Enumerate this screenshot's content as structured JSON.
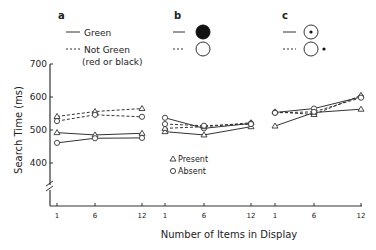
{
  "panels": [
    {
      "label": "a",
      "legend": [
        {
          "style": "solid",
          "text": "Green"
        },
        {
          "style": "dashed",
          "text": "Not Green"
        },
        {
          "style": "none",
          "text": "(red or black)"
        }
      ]
    },
    {
      "label": "b",
      "legend": [
        {
          "style": "solid",
          "icon": "filled-circle"
        },
        {
          "style": "dashed",
          "icon": "open-circle"
        }
      ]
    },
    {
      "label": "c",
      "legend": [
        {
          "style": "solid",
          "icon": "circle-with-dot-inside"
        },
        {
          "style": "dashed",
          "icon": "circle-with-dot-outside"
        }
      ]
    }
  ],
  "marker_legend": {
    "present": "Present",
    "absent": "Absent"
  },
  "axes": {
    "ylabel": "Search Time (ms)",
    "xlabel": "Number of Items in Display",
    "yticks": [
      "700",
      "600",
      "500",
      "400"
    ],
    "xticks": [
      "1",
      "6",
      "12",
      "1",
      "6",
      "12",
      "1",
      "6",
      "12"
    ]
  },
  "chart_data": {
    "type": "line",
    "title": "",
    "xlabel": "Number of Items in Display",
    "ylabel": "Search Time (ms)",
    "ylim": [
      300,
      700
    ],
    "y_axis_break": true,
    "grid": false,
    "legend_position": "top (per panel) and inset in panel b",
    "x": [
      1,
      6,
      12
    ],
    "panels": [
      {
        "label": "a",
        "series": [
          {
            "name": "Green - Present",
            "line": "solid",
            "marker": "triangle",
            "values": [
              492,
              485,
              490
            ]
          },
          {
            "name": "Green - Absent",
            "line": "solid",
            "marker": "circle",
            "values": [
              461,
              475,
              476
            ]
          },
          {
            "name": "Not Green - Present",
            "line": "dashed",
            "marker": "triangle",
            "values": [
              541,
              556,
              565
            ]
          },
          {
            "name": "Not Green - Absent",
            "line": "dashed",
            "marker": "circle",
            "values": [
              527,
              546,
              540
            ]
          }
        ]
      },
      {
        "label": "b",
        "series": [
          {
            "name": "Filled circle - Present",
            "line": "solid",
            "marker": "triangle",
            "values": [
              495,
              485,
              510
            ]
          },
          {
            "name": "Filled circle - Absent",
            "line": "solid",
            "marker": "circle",
            "values": [
              537,
              505,
              520
            ]
          },
          {
            "name": "Open circle - Present",
            "line": "dashed",
            "marker": "triangle",
            "values": [
              505,
              510,
              522
            ]
          },
          {
            "name": "Open circle - Absent",
            "line": "dashed",
            "marker": "circle",
            "values": [
              518,
              513,
              518
            ]
          }
        ]
      },
      {
        "label": "c",
        "series": [
          {
            "name": "Dot inside - Present",
            "line": "solid",
            "marker": "triangle",
            "values": [
              512,
              553,
              563
            ]
          },
          {
            "name": "Dot inside - Absent",
            "line": "solid",
            "marker": "circle",
            "values": [
              553,
              565,
              600
            ]
          },
          {
            "name": "Dot outside - Present",
            "line": "dashed",
            "marker": "triangle",
            "values": [
              555,
              547,
              605
            ]
          },
          {
            "name": "Dot outside - Absent",
            "line": "dashed",
            "marker": "circle",
            "values": [
              552,
              555,
              598
            ]
          }
        ]
      }
    ]
  }
}
